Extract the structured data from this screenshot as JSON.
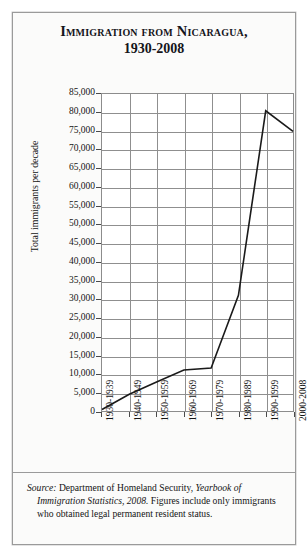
{
  "figure": {
    "title_line1": "Immigration from Nicaragua,",
    "title_line2": "1930-2008",
    "source_label": "Source:",
    "source_text_1": " Department of Homeland Security, ",
    "source_italic_2": "Yearbook of Immigration Statistics, 2008.",
    "source_text_3": " Figures include only immigrants who obtained legal permanent resident status."
  },
  "colors": {
    "line": "#1a1a1a",
    "grid": "#8f8f8f",
    "frame": "#8c8c8c",
    "background": "#fbfbfa",
    "plot_background": "#ffffff",
    "text": "#141414"
  },
  "chart_data": {
    "type": "line",
    "title": "Immigration from Nicaragua, 1930-2008",
    "xlabel": "",
    "ylabel": "Total immigrants per decade",
    "categories": [
      "1930-1939",
      "1940-1949",
      "1950-1959",
      "1960-1969",
      "1970-1979",
      "1980-1989",
      "1990-1999",
      "2000-2008"
    ],
    "values": [
      400,
      4500,
      7800,
      11000,
      11500,
      31000,
      80500,
      75000
    ],
    "ylim": [
      0,
      85000
    ],
    "ytick_step": 5000,
    "yticks": [
      "85,000",
      "80,000",
      "75,000",
      "70,000",
      "65,000",
      "60,000",
      "55,000",
      "50,000",
      "45,000",
      "40,000",
      "35,000",
      "30,000",
      "25,000",
      "20,000",
      "15,000",
      "10,000",
      "5,000",
      "0"
    ],
    "ytick_values": [
      85000,
      80000,
      75000,
      70000,
      65000,
      60000,
      55000,
      50000,
      45000,
      40000,
      35000,
      30000,
      25000,
      20000,
      15000,
      10000,
      5000,
      0
    ],
    "grid": true,
    "legend": "none",
    "series": [
      {
        "name": "Total immigrants per decade",
        "values": [
          400,
          4500,
          7800,
          11000,
          11500,
          31000,
          80500,
          75000
        ]
      }
    ]
  }
}
